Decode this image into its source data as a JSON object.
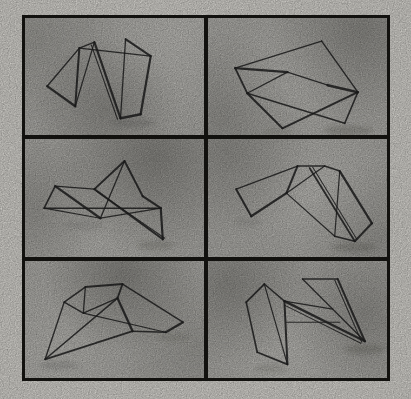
{
  "figure": {
    "description": "Scanned grayscale figure: 2-column by 3-row grid of six bent-wire 3D wireframe objects on mottled gray backgrounds inside a black frame",
    "grid": {
      "rows": 3,
      "cols": 2
    },
    "colors": {
      "paper": "#edebe5",
      "frame": "#1a1915",
      "panel_bg": "#c2c1bc",
      "wire": "#242424",
      "shadow": "#4a4943",
      "cloud_dark": [
        70,
        69,
        64
      ],
      "cloud_light": [
        246,
        245,
        240
      ]
    },
    "viewbox": "0 0 178 117",
    "panels": [
      {
        "name": "wire-object-1",
        "segments": [
          [
            22,
            68,
            54,
            30,
            1.4
          ],
          [
            22,
            68,
            50,
            88,
            2.2
          ],
          [
            50,
            88,
            54,
            30,
            2.0
          ],
          [
            50,
            88,
            69,
            24,
            1.2
          ],
          [
            54,
            30,
            69,
            24,
            1.4
          ],
          [
            54,
            30,
            125,
            38,
            1.3
          ],
          [
            69,
            24,
            95,
            100,
            2.2
          ],
          [
            66,
            27,
            92,
            101,
            1.1
          ],
          [
            100,
            21,
            125,
            38,
            2.0
          ],
          [
            125,
            38,
            115,
            96,
            2.2
          ],
          [
            115,
            96,
            95,
            100,
            2.4
          ],
          [
            95,
            100,
            100,
            21,
            1.3
          ]
        ],
        "shadows": [
          [
            108,
            105,
            22,
            4,
            0.18
          ]
        ],
        "clouds": [
          [
            45,
            78,
            55,
            0.28
          ],
          [
            6,
            18,
            45,
            0.15
          ],
          [
            85,
            15,
            50,
            -0.3
          ]
        ]
      },
      {
        "name": "wire-object-2",
        "segments": [
          [
            113,
            23,
            27,
            50,
            1.4
          ],
          [
            27,
            50,
            39,
            75,
            1.8
          ],
          [
            27,
            50,
            79,
            54,
            2.4
          ],
          [
            79,
            54,
            39,
            75,
            1.2
          ],
          [
            113,
            23,
            149,
            74,
            1.4
          ],
          [
            119,
            67,
            149,
            74,
            2.6
          ],
          [
            79,
            54,
            119,
            67,
            1.2
          ],
          [
            39,
            75,
            136,
            105,
            1.4
          ],
          [
            39,
            75,
            74,
            110,
            2.0
          ],
          [
            74,
            110,
            149,
            74,
            2.0
          ],
          [
            136,
            105,
            149,
            74,
            1.6
          ]
        ],
        "shadows": [
          [
            140,
            112,
            24,
            5,
            0.22
          ],
          [
            70,
            113,
            14,
            3,
            0.15
          ]
        ],
        "clouds": [
          [
            85,
            10,
            50,
            0.3
          ],
          [
            8,
            85,
            45,
            0.22
          ],
          [
            45,
            55,
            60,
            -0.25
          ]
        ]
      },
      {
        "name": "wire-object-3",
        "segments": [
          [
            19,
            69,
            30,
            47,
            1.6
          ],
          [
            30,
            47,
            69,
            50,
            1.4
          ],
          [
            69,
            50,
            99,
            22,
            2.0
          ],
          [
            99,
            22,
            117,
            57,
            2.0
          ],
          [
            99,
            22,
            75,
            79,
            1.3
          ],
          [
            19,
            69,
            135,
            69,
            1.5
          ],
          [
            30,
            47,
            75,
            79,
            2.3
          ],
          [
            19,
            69,
            75,
            79,
            1.2
          ],
          [
            75,
            79,
            135,
            69,
            1.3
          ],
          [
            117,
            57,
            135,
            69,
            2.2
          ],
          [
            135,
            69,
            137,
            100,
            2.2
          ],
          [
            137,
            100,
            69,
            50,
            2.0
          ],
          [
            139,
            99,
            71,
            52,
            1.0
          ]
        ],
        "shadows": [
          [
            130,
            106,
            18,
            4,
            0.2
          ],
          [
            58,
            86,
            20,
            4,
            0.12
          ]
        ],
        "clouds": [
          [
            72,
            15,
            60,
            0.35
          ],
          [
            5,
            60,
            40,
            0.2
          ],
          [
            35,
            92,
            50,
            -0.2
          ]
        ]
      },
      {
        "name": "wire-object-4",
        "segments": [
          [
            28,
            50,
            89,
            27,
            1.4
          ],
          [
            28,
            50,
            43,
            77,
            2.0
          ],
          [
            43,
            77,
            78,
            54,
            2.3
          ],
          [
            78,
            54,
            89,
            27,
            2.0
          ],
          [
            89,
            27,
            116,
            27,
            1.4
          ],
          [
            116,
            27,
            78,
            54,
            1.2
          ],
          [
            116,
            27,
            131,
            32,
            1.6
          ],
          [
            131,
            32,
            163,
            84,
            2.3
          ],
          [
            163,
            84,
            146,
            102,
            2.0
          ],
          [
            146,
            102,
            126,
            97,
            1.6
          ],
          [
            126,
            97,
            131,
            32,
            1.2
          ],
          [
            101,
            29,
            146,
            102,
            1.8
          ],
          [
            104,
            28,
            148,
            100,
            1.0
          ],
          [
            78,
            54,
            126,
            97,
            1.2
          ]
        ],
        "shadows": [
          [
            145,
            108,
            22,
            5,
            0.22
          ],
          [
            40,
            83,
            14,
            3,
            0.12
          ]
        ],
        "clouds": [
          [
            10,
            10,
            45,
            0.25
          ],
          [
            95,
            85,
            40,
            0.18
          ],
          [
            60,
            45,
            60,
            -0.28
          ]
        ]
      },
      {
        "name": "wire-object-5",
        "segments": [
          [
            60,
            26,
            97,
            23,
            2.0
          ],
          [
            60,
            26,
            39,
            41,
            1.6
          ],
          [
            39,
            41,
            20,
            98,
            1.4
          ],
          [
            60,
            26,
            58,
            52,
            1.3
          ],
          [
            39,
            41,
            58,
            52,
            1.4
          ],
          [
            97,
            23,
            157,
            61,
            1.5
          ],
          [
            97,
            23,
            92,
            37,
            1.8
          ],
          [
            92,
            37,
            107,
            70,
            2.3
          ],
          [
            92,
            37,
            58,
            52,
            1.4
          ],
          [
            20,
            98,
            92,
            37,
            1.5
          ],
          [
            20,
            98,
            107,
            70,
            1.8
          ],
          [
            107,
            70,
            140,
            71,
            1.4
          ],
          [
            140,
            71,
            157,
            61,
            2.2
          ],
          [
            58,
            52,
            140,
            71,
            1.1
          ]
        ],
        "shadows": [
          [
            34,
            104,
            20,
            4,
            0.18
          ],
          [
            148,
            76,
            16,
            4,
            0.15
          ]
        ],
        "clouds": [
          [
            55,
            12,
            55,
            0.35
          ],
          [
            95,
            75,
            40,
            0.15
          ],
          [
            18,
            80,
            50,
            -0.2
          ]
        ]
      },
      {
        "name": "wire-object-6",
        "segments": [
          [
            56,
            23,
            38,
            41,
            1.8
          ],
          [
            38,
            41,
            49,
            91,
            1.6
          ],
          [
            49,
            91,
            79,
            103,
            1.8
          ],
          [
            79,
            103,
            76,
            40,
            2.0
          ],
          [
            76,
            40,
            56,
            23,
            1.4
          ],
          [
            56,
            23,
            79,
            103,
            1.2
          ],
          [
            94,
            18,
            129,
            18,
            1.6
          ],
          [
            94,
            18,
            156,
            80,
            1.3
          ],
          [
            129,
            18,
            156,
            80,
            2.0
          ],
          [
            126,
            19,
            153,
            81,
            1.0
          ],
          [
            76,
            40,
            156,
            80,
            2.3
          ],
          [
            76,
            44,
            152,
            82,
            1.1
          ],
          [
            76,
            40,
            124,
            48,
            1.1
          ],
          [
            78,
            61,
            131,
            61,
            1.1
          ]
        ],
        "shadows": [
          [
            156,
            88,
            20,
            5,
            0.22
          ],
          [
            62,
            107,
            16,
            4,
            0.15
          ]
        ],
        "clouds": [
          [
            12,
            20,
            45,
            0.3
          ],
          [
            88,
            45,
            45,
            0.25
          ],
          [
            45,
            82,
            55,
            -0.25
          ]
        ]
      }
    ]
  }
}
